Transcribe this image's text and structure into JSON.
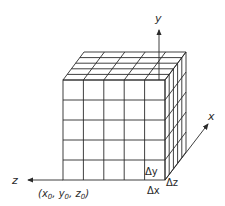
{
  "diagram": {
    "type": "3d-grid-cube",
    "divisions": 5,
    "axes": {
      "y": {
        "label": "y"
      },
      "z": {
        "label": "z"
      },
      "x": {
        "label": "x"
      }
    },
    "labels": {
      "origin": "(x₀, y₀, z₀)",
      "origin_main": "(x",
      "delta_y": "Δy",
      "delta_z": "Δz",
      "delta_x": "Δx"
    }
  }
}
